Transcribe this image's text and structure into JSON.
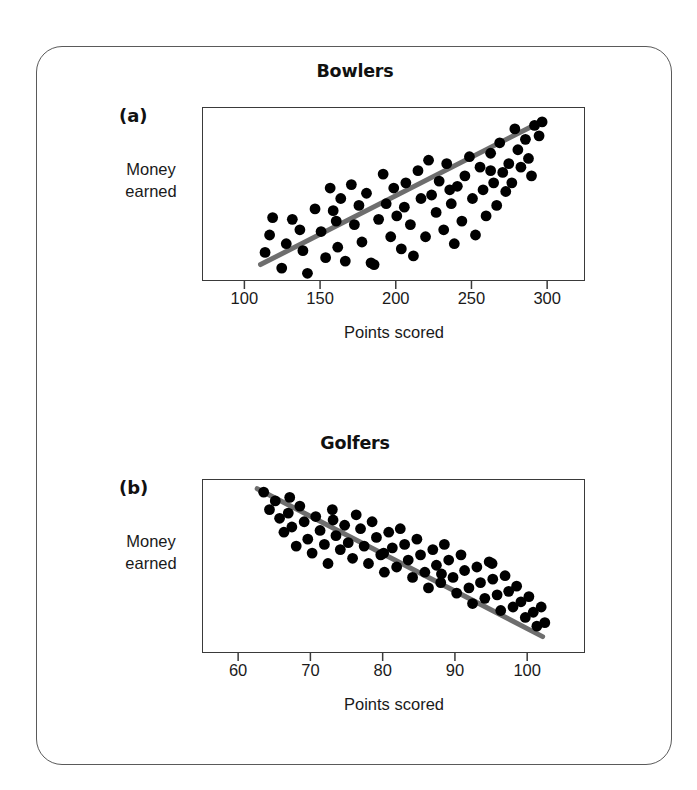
{
  "figure": {
    "background_color": "#ffffff",
    "card_border_color": "#5a5a5a",
    "point_color": "#000000",
    "trendline_color": "#6e6e6e",
    "axis_color": "#3a3a3a"
  },
  "panels": [
    {
      "tag": "(a)",
      "title": "Bowlers",
      "y_label_line1": "Money",
      "y_label_line2": "earned",
      "x_label": "Points scored"
    },
    {
      "tag": "(b)",
      "title": "Golfers",
      "y_label_line1": "Money",
      "y_label_line2": "earned",
      "x_label": "Points scored"
    }
  ],
  "chart_data": [
    {
      "type": "scatter",
      "title": "Bowlers",
      "panel_tag": "(a)",
      "xlabel": "Points scored",
      "ylabel": "Money earned",
      "xlim": [
        72,
        325
      ],
      "ylim": [
        0,
        100
      ],
      "x_ticks": [
        100,
        150,
        200,
        250,
        300
      ],
      "x_tick_labels": [
        "100",
        "150",
        "200",
        "250",
        "300"
      ],
      "y_ticks": [],
      "grid": false,
      "legend": null,
      "correlation": "positive",
      "trendline": {
        "type": "linear",
        "x_start": 110,
        "y_start": 10,
        "x_end": 295,
        "y_end": 92
      },
      "points": [
        [
          113,
          17
        ],
        [
          116,
          27
        ],
        [
          118,
          37
        ],
        [
          124,
          8
        ],
        [
          127,
          22
        ],
        [
          131,
          36
        ],
        [
          136,
          30
        ],
        [
          138,
          18
        ],
        [
          141,
          5
        ],
        [
          146,
          42
        ],
        [
          150,
          29
        ],
        [
          153,
          14
        ],
        [
          156,
          54
        ],
        [
          158,
          41
        ],
        [
          161,
          20
        ],
        [
          163,
          48
        ],
        [
          166,
          12
        ],
        [
          170,
          56
        ],
        [
          172,
          33
        ],
        [
          175,
          44
        ],
        [
          177,
          23
        ],
        [
          180,
          51
        ],
        [
          183,
          11
        ],
        [
          185,
          10
        ],
        [
          188,
          36
        ],
        [
          191,
          62
        ],
        [
          193,
          45
        ],
        [
          196,
          26
        ],
        [
          198,
          54
        ],
        [
          200,
          38
        ],
        [
          203,
          19
        ],
        [
          206,
          57
        ],
        [
          209,
          33
        ],
        [
          211,
          15
        ],
        [
          214,
          64
        ],
        [
          216,
          48
        ],
        [
          219,
          26
        ],
        [
          221,
          70
        ],
        [
          223,
          50
        ],
        [
          226,
          40
        ],
        [
          228,
          58
        ],
        [
          231,
          30
        ],
        [
          233,
          68
        ],
        [
          236,
          45
        ],
        [
          238,
          22
        ],
        [
          240,
          55
        ],
        [
          243,
          35
        ],
        [
          245,
          61
        ],
        [
          248,
          72
        ],
        [
          250,
          48
        ],
        [
          252,
          27
        ],
        [
          255,
          66
        ],
        [
          257,
          53
        ],
        [
          259,
          38
        ],
        [
          262,
          74
        ],
        [
          264,
          57
        ],
        [
          266,
          44
        ],
        [
          268,
          80
        ],
        [
          270,
          63
        ],
        [
          272,
          52
        ],
        [
          274,
          68
        ],
        [
          276,
          57
        ],
        [
          278,
          88
        ],
        [
          280,
          76
        ],
        [
          282,
          66
        ],
        [
          285,
          82
        ],
        [
          287,
          71
        ],
        [
          289,
          61
        ],
        [
          291,
          90
        ],
        [
          294,
          84
        ],
        [
          296,
          92
        ],
        [
          160,
          35
        ],
        [
          205,
          43
        ],
        [
          235,
          53
        ],
        [
          262,
          64
        ]
      ]
    },
    {
      "type": "scatter",
      "title": "Golfers",
      "panel_tag": "(b)",
      "xlabel": "Points scored",
      "ylabel": "Money earned",
      "xlim": [
        55,
        108
      ],
      "ylim": [
        0,
        100
      ],
      "x_ticks": [
        60,
        70,
        80,
        90,
        100
      ],
      "x_tick_labels": [
        "60",
        "70",
        "80",
        "90",
        "100"
      ],
      "y_ticks": [],
      "grid": false,
      "legend": null,
      "correlation": "negative",
      "trendline": {
        "type": "linear",
        "x_start": 62.5,
        "y_start": 95,
        "x_end": 102,
        "y_end": 10
      },
      "points": [
        [
          63.4,
          93
        ],
        [
          64.2,
          83
        ],
        [
          65.0,
          88
        ],
        [
          65.6,
          78
        ],
        [
          66.2,
          70
        ],
        [
          66.8,
          81
        ],
        [
          67.3,
          73
        ],
        [
          67.9,
          62
        ],
        [
          68.4,
          85
        ],
        [
          69.0,
          76
        ],
        [
          69.5,
          66
        ],
        [
          70.1,
          58
        ],
        [
          70.6,
          79
        ],
        [
          71.2,
          71
        ],
        [
          71.8,
          63
        ],
        [
          72.3,
          52
        ],
        [
          72.9,
          83
        ],
        [
          73.4,
          68
        ],
        [
          74.0,
          60
        ],
        [
          74.6,
          74
        ],
        [
          75.1,
          64
        ],
        [
          75.7,
          55
        ],
        [
          76.2,
          80
        ],
        [
          76.8,
          72
        ],
        [
          77.3,
          62
        ],
        [
          77.9,
          52
        ],
        [
          78.4,
          76
        ],
        [
          79.0,
          67
        ],
        [
          79.6,
          57
        ],
        [
          80.1,
          47
        ],
        [
          80.7,
          70
        ],
        [
          81.2,
          61
        ],
        [
          81.8,
          50
        ],
        [
          82.3,
          72
        ],
        [
          82.9,
          63
        ],
        [
          83.4,
          54
        ],
        [
          84.0,
          44
        ],
        [
          84.6,
          66
        ],
        [
          85.1,
          57
        ],
        [
          85.7,
          47
        ],
        [
          86.2,
          38
        ],
        [
          86.8,
          60
        ],
        [
          87.3,
          51
        ],
        [
          87.9,
          41
        ],
        [
          88.4,
          63
        ],
        [
          89.0,
          54
        ],
        [
          89.6,
          44
        ],
        [
          90.1,
          35
        ],
        [
          90.7,
          57
        ],
        [
          91.2,
          48
        ],
        [
          91.8,
          38
        ],
        [
          92.3,
          29
        ],
        [
          92.9,
          50
        ],
        [
          93.4,
          41
        ],
        [
          94.0,
          32
        ],
        [
          94.6,
          53
        ],
        [
          95.1,
          43
        ],
        [
          95.7,
          34
        ],
        [
          96.2,
          25
        ],
        [
          96.8,
          45
        ],
        [
          97.3,
          36
        ],
        [
          97.9,
          27
        ],
        [
          98.4,
          39
        ],
        [
          99.0,
          30
        ],
        [
          99.6,
          21
        ],
        [
          100.1,
          33
        ],
        [
          100.7,
          24
        ],
        [
          101.2,
          16
        ],
        [
          101.8,
          27
        ],
        [
          102.3,
          18
        ],
        [
          95.0,
          52
        ],
        [
          88.0,
          46
        ],
        [
          80.0,
          58
        ],
        [
          73.0,
          77
        ],
        [
          67.0,
          90
        ]
      ]
    }
  ]
}
